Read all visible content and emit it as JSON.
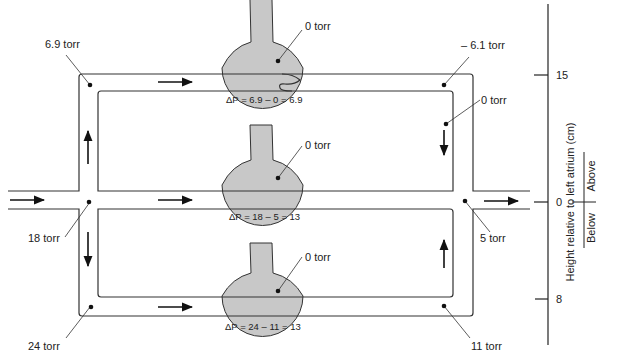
{
  "figure": {
    "colors": {
      "line": "#333333",
      "vessel_fill": "#c8c8c8",
      "background": "#ffffff"
    }
  },
  "pressures": {
    "top_left": "6.9 torr",
    "top_right": "– 6.1 torr",
    "top_right_lower": "0 torr",
    "middle_left": "18 torr",
    "middle_right": "5 torr",
    "bottom_left": "24 torr",
    "bottom_right": "11 torr"
  },
  "alveoli": [
    {
      "zone": "top",
      "pressure": "0 torr",
      "delta_p": "ΔP = 6.9 – 0 = 6.9"
    },
    {
      "zone": "middle",
      "pressure": "0 torr",
      "delta_p": "ΔP = 18 – 5 = 13"
    },
    {
      "zone": "bottom",
      "pressure": "0 torr",
      "delta_p": "ΔP = 24 – 11 = 13"
    }
  ],
  "axis": {
    "label": "Height relative to left atrium (cm)",
    "ticks": [
      {
        "value": "15",
        "position": "top"
      },
      {
        "value": "0",
        "position": "middle"
      },
      {
        "value": "8",
        "position": "bottom"
      }
    ],
    "above_label": "Above",
    "below_label": "Below"
  }
}
